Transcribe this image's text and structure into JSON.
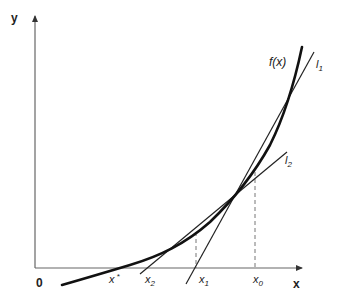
{
  "diagram": {
    "axes": {
      "x_label": "x",
      "y_label": "y",
      "origin_label": "0"
    },
    "curve": {
      "label": "f(x)"
    },
    "tangent_lines": [
      {
        "name": "l1",
        "label_base": "l",
        "label_sub": "1",
        "tangent_at": "x0"
      },
      {
        "name": "l2",
        "label_base": "l",
        "label_sub": "2",
        "tangent_at": "x1"
      }
    ],
    "x_points": [
      {
        "name": "x-star",
        "base": "x",
        "sup": "*"
      },
      {
        "name": "x2",
        "base": "x",
        "sub": "2"
      },
      {
        "name": "x1",
        "base": "x",
        "sub": "1"
      },
      {
        "name": "x0",
        "base": "x",
        "sub": "0"
      }
    ],
    "colors": {
      "axis": "#555555",
      "curve": "#111111",
      "tangent": "#222222",
      "dashed": "#777777"
    }
  }
}
